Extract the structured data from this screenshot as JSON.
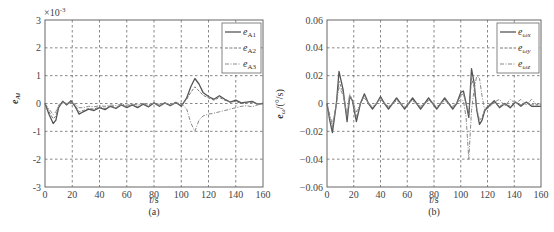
{
  "chart_data": [
    {
      "type": "line",
      "panel": "(a)",
      "title": "",
      "xlabel": "t/s",
      "ylabel": "e_Ai",
      "y_multiplier": "×10^-3",
      "xlim": [
        0,
        160
      ],
      "ylim": [
        -3,
        3
      ],
      "xticks": [
        0,
        20,
        40,
        60,
        80,
        100,
        120,
        140,
        160
      ],
      "yticks": [
        -3,
        -2,
        -1,
        0,
        1,
        2,
        3
      ],
      "grid": true,
      "legend_position": "upper right",
      "x": [
        0,
        3,
        6,
        8,
        10,
        13,
        16,
        19,
        22,
        25,
        28,
        32,
        36,
        40,
        44,
        48,
        52,
        56,
        60,
        64,
        68,
        72,
        76,
        80,
        84,
        88,
        92,
        96,
        100,
        104,
        107,
        110,
        113,
        116,
        120,
        124,
        128,
        132,
        136,
        140,
        144,
        148,
        152,
        156,
        160
      ],
      "series": [
        {
          "name": "e_A1",
          "style": "solid",
          "values": [
            0,
            -0.4,
            -0.72,
            -0.6,
            -0.15,
            0.08,
            -0.05,
            0.1,
            -0.1,
            -0.38,
            -0.3,
            -0.2,
            -0.25,
            -0.15,
            -0.22,
            -0.1,
            -0.18,
            -0.05,
            -0.15,
            -0.05,
            -0.15,
            -0.02,
            -0.12,
            0.02,
            -0.1,
            0.02,
            -0.08,
            0.04,
            -0.1,
            0.2,
            0.6,
            0.9,
            0.7,
            0.4,
            0.25,
            0.15,
            0.28,
            0.15,
            0.05,
            0.12,
            0.02,
            0.05,
            0.08,
            -0.02,
            0
          ]
        },
        {
          "name": "e_A2",
          "style": "dashed",
          "values": [
            0,
            -0.3,
            -0.55,
            -0.45,
            -0.1,
            0.05,
            -0.05,
            0.05,
            -0.05,
            -0.3,
            -0.25,
            -0.18,
            -0.2,
            -0.12,
            -0.18,
            -0.08,
            -0.15,
            -0.05,
            -0.12,
            -0.04,
            -0.12,
            0,
            -0.1,
            0.02,
            -0.08,
            0.02,
            -0.06,
            0.03,
            -0.05,
            0.15,
            0.4,
            0.6,
            0.45,
            0.3,
            0.2,
            0.12,
            0.22,
            0.12,
            0.05,
            0.08,
            0,
            0.02,
            0.05,
            -0.02,
            0
          ]
        },
        {
          "name": "e_A3",
          "style": "dash-dot",
          "values": [
            0,
            -0.2,
            -0.4,
            -0.3,
            -0.05,
            0.05,
            0,
            0.05,
            -0.02,
            -0.15,
            -0.15,
            -0.1,
            -0.12,
            -0.08,
            -0.1,
            -0.05,
            -0.08,
            -0.02,
            -0.06,
            -0.02,
            -0.05,
            0,
            -0.04,
            0.01,
            -0.03,
            0.01,
            -0.02,
            0.02,
            0,
            -0.2,
            -0.7,
            -1.0,
            -0.6,
            -0.45,
            -0.38,
            -0.35,
            -0.3,
            -0.25,
            -0.2,
            -0.15,
            -0.1,
            -0.08,
            -0.12,
            -0.05,
            0
          ]
        }
      ]
    },
    {
      "type": "line",
      "panel": "(b)",
      "title": "",
      "xlabel": "t/s",
      "ylabel": "e_ωi/(°/s)",
      "xlim": [
        0,
        160
      ],
      "ylim": [
        -0.06,
        0.06
      ],
      "xticks": [
        0,
        20,
        40,
        60,
        80,
        100,
        120,
        140,
        160
      ],
      "yticks": [
        -0.06,
        -0.04,
        -0.02,
        0,
        0.02,
        0.04,
        0.06
      ],
      "grid": true,
      "legend_position": "upper right",
      "x": [
        0,
        2,
        4,
        7,
        9,
        12,
        15,
        17,
        19,
        22,
        25,
        28,
        31,
        34,
        37,
        40,
        43,
        46,
        49,
        52,
        55,
        58,
        61,
        64,
        67,
        70,
        73,
        76,
        79,
        82,
        85,
        88,
        91,
        94,
        97,
        100,
        102,
        104,
        106,
        108,
        110,
        112,
        114,
        116,
        118,
        121,
        125,
        129,
        133,
        137,
        141,
        145,
        149,
        153,
        157,
        160
      ],
      "series": [
        {
          "name": "e_ωx",
          "style": "solid",
          "values": [
            0,
            -0.012,
            -0.021,
            0,
            0.023,
            0.01,
            -0.013,
            0.005,
            0.002,
            -0.013,
            0,
            0.007,
            0,
            -0.004,
            0,
            0.005,
            0,
            -0.004,
            0,
            0.004,
            0,
            -0.004,
            0,
            0.004,
            0,
            -0.004,
            0,
            0.004,
            0,
            -0.004,
            0,
            0.004,
            0,
            -0.004,
            0,
            0.008,
            0.009,
            0,
            -0.01,
            0.025,
            0.015,
            -0.005,
            -0.015,
            -0.012,
            -0.005,
            -0.002,
            0.002,
            -0.003,
            0,
            -0.003,
            0.001,
            -0.002,
            0.001,
            -0.002,
            -0.002,
            -0.002
          ]
        },
        {
          "name": "e_ωy",
          "style": "dashed",
          "values": [
            0,
            -0.01,
            -0.018,
            0,
            0.016,
            0.008,
            -0.01,
            0.006,
            0.002,
            -0.01,
            0,
            0.006,
            0,
            -0.003,
            0,
            0.004,
            0,
            -0.003,
            0,
            0.003,
            0,
            -0.003,
            0,
            0.003,
            0,
            -0.003,
            0,
            0.003,
            0,
            -0.003,
            0,
            0.003,
            0,
            -0.003,
            0,
            0.006,
            0.007,
            0,
            -0.008,
            0.018,
            0.012,
            -0.004,
            -0.012,
            -0.01,
            -0.004,
            -0.001,
            0.001,
            -0.002,
            0,
            -0.002,
            0.001,
            -0.001,
            0.001,
            -0.001,
            -0.001,
            -0.001
          ]
        },
        {
          "name": "e_ωz",
          "style": "dash-dot",
          "values": [
            0,
            -0.008,
            -0.015,
            0,
            0.012,
            0.006,
            -0.008,
            0.007,
            0.002,
            -0.006,
            0,
            0.004,
            0,
            -0.002,
            0,
            0.003,
            0,
            -0.002,
            0,
            0.002,
            0,
            -0.002,
            0,
            0.002,
            0,
            -0.002,
            0,
            0.002,
            0,
            -0.002,
            0,
            0.002,
            0,
            -0.002,
            0,
            0.003,
            0.002,
            -0.01,
            -0.04,
            -0.005,
            0.01,
            0.02,
            0.018,
            0.005,
            -0.005,
            -0.003,
            0.001,
            0.003,
            -0.002,
            0.003,
            0,
            0.003,
            -0.001,
            0.003,
            -0.001,
            0
          ]
        }
      ]
    }
  ],
  "panels": {
    "a": {
      "caption": "(a)",
      "xlabel": "t/s",
      "ylabel": "e_Ai",
      "multiplier": "×10",
      "multiplier_exp": "-3",
      "yticks": [
        "3",
        "2",
        "1",
        "0",
        "-1",
        "-2",
        "-3"
      ],
      "xticks": [
        "0",
        "20",
        "40",
        "60",
        "80",
        "100",
        "120",
        "140",
        "160"
      ],
      "legend": [
        {
          "base": "e",
          "sub": "A1"
        },
        {
          "base": "e",
          "sub": "A2"
        },
        {
          "base": "e",
          "sub": "A3"
        }
      ]
    },
    "b": {
      "caption": "(b)",
      "xlabel": "t/s",
      "ylabel": "e_ωi/(°/s)",
      "yticks": [
        "0.06",
        "0.04",
        "0.02",
        "0",
        "−0.02",
        "−0.04",
        "−0.06"
      ],
      "xticks": [
        "0",
        "20",
        "40",
        "60",
        "80",
        "100",
        "120",
        "140",
        "160"
      ],
      "legend": [
        {
          "base": "e",
          "sub": "ωx"
        },
        {
          "base": "e",
          "sub": "ωy"
        },
        {
          "base": "e",
          "sub": "ωz"
        }
      ]
    }
  }
}
